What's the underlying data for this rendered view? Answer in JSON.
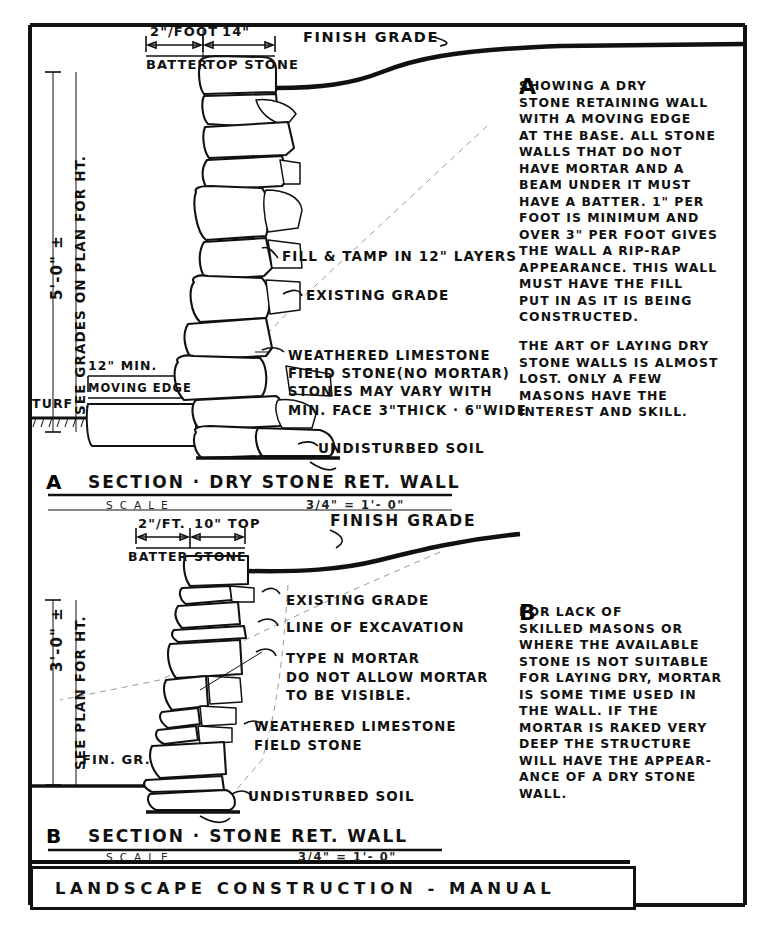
{
  "sheet": {
    "footer_title": "LANDSCAPE  CONSTRUCTION - MANUAL"
  },
  "section_a": {
    "letter": "A",
    "title": "SECTION · DRY STONE RET. WALL",
    "scale_word": "SCALE",
    "scale_value": "3/4\" = 1'- 0\"",
    "dimensions": {
      "batter_value": "2\"/FOOT",
      "batter_label": "BATTER",
      "top_stone_value": "14\"",
      "top_stone_label": "TOP STONE",
      "height_value": "5'-0\" ±",
      "height_note": "SEE GRADES ON PLAN FOR HT.",
      "footing_width": "12\" MIN.",
      "footing_label": "MOVING EDGE"
    },
    "callouts": [
      "FINISH GRADE",
      "FILL & TAMP IN 12\" LAYERS",
      "EXISTING GRADE",
      "WEATHERED LIMESTONE\nFIELD STONE(NO MORTAR)\nSTONES MAY VARY WITH\nMIN. FACE 3\"THICK · 6\"WIDE",
      "UNDISTURBED SOIL",
      "TURF"
    ]
  },
  "section_b": {
    "letter": "B",
    "title": "SECTION · STONE RET. WALL",
    "scale_word": "SCALE",
    "scale_value": "3/4\" = 1'- 0\"",
    "dimensions": {
      "batter_value": "2\"/FT.",
      "batter_label": "BATTER",
      "top_stone_value": "10\" TOP",
      "top_stone_label": "STONE",
      "height_value": "3'-0\" ±",
      "height_note": "SEE PLAN FOR HT."
    },
    "callouts": [
      "FINISH GRADE",
      "EXISTING GRADE",
      "LINE OF EXCAVATION",
      "TYPE N MORTAR\nDO NOT ALLOW MORTAR\nTO BE VISIBLE.",
      "WEATHERED LIMESTONE\nFIELD STONE",
      "UNDISTURBED SOIL",
      "FIN. GR."
    ]
  },
  "notes": {
    "a": {
      "letter": "A",
      "paragraph_1": "         SHOWING A DRY\nSTONE RETAINING WALL\nWITH A MOVING EDGE\nAT THE BASE. ALL STONE\nWALLS THAT DO NOT\nHAVE MORTAR AND A\nBEAM UNDER IT MUST\nHAVE A BATTER. 1\" PER\nFOOT IS MINIMUM AND\nOVER 3\" PER FOOT GIVES\nTHE WALL A RIP-RAP\nAPPEARANCE. THIS WALL\nMUST HAVE THE FILL\nPUT IN AS IT IS BEING\nCONSTRUCTED.",
      "paragraph_2": "THE ART OF LAYING DRY\nSTONE WALLS IS ALMOST\nLOST. ONLY A FEW\nMASONS HAVE THE\nINTEREST AND SKILL."
    },
    "b": {
      "letter": "B",
      "paragraph_1": "       FOR LACK OF\nSKILLED MASONS OR\nWHERE THE AVAILABLE\nSTONE IS NOT SUITABLE\nFOR LAYING DRY, MORTAR\nIS SOME TIME USED IN\nTHE WALL. IF THE\nMORTAR IS RAKED VERY\nDEEP THE STRUCTURE\nWILL HAVE THE APPEAR-\nANCE OF A DRY STONE\nWALL."
    }
  },
  "colors": {
    "ink": "#111111",
    "paper": "#ffffff",
    "dashed": "#9a9a9a"
  }
}
